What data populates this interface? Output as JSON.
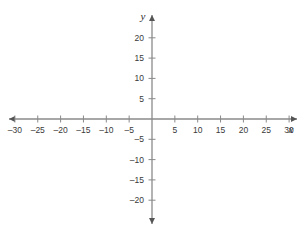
{
  "figure": {
    "title": "",
    "background_color": "#ffffff",
    "axis_color": "#8a8a8a",
    "label_color": "#3a3a3a",
    "x_axis_name": "x",
    "y_axis_name": "y"
  },
  "chart_data": {
    "type": "scatter",
    "title": "",
    "subtitle": "",
    "xlabel": "x",
    "ylabel": "y",
    "xlim": [
      -32,
      32
    ],
    "ylim": [
      -22,
      22
    ],
    "xticks": [
      -30,
      -25,
      -20,
      -15,
      -10,
      -5,
      5,
      10,
      15,
      20,
      25,
      30
    ],
    "yticks": [
      20,
      15,
      10,
      5,
      -5,
      -10,
      -15,
      -20
    ],
    "xtick_labels": [
      "–30",
      "–25",
      "–20",
      "–15",
      "–10",
      "–5",
      "5",
      "10",
      "15",
      "20",
      "25",
      "30"
    ],
    "ytick_labels": [
      "20",
      "15",
      "10",
      "5",
      "–5",
      "–10",
      "–15",
      "–20"
    ],
    "xtick_step": 5,
    "ytick_step": 5,
    "grid": false,
    "legend": null,
    "series": [],
    "annotations": [],
    "origin_label": "",
    "arrows": [
      "left",
      "right",
      "up",
      "down"
    ]
  }
}
